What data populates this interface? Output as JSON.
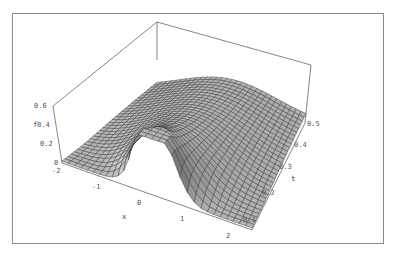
{
  "chart_data": {
    "type": "surface3d",
    "title": "",
    "function_description": "Gaussian diffusion profile f(x,t), peak at x=0 for small t, spreading and flattening as t increases",
    "axes": {
      "x": {
        "label": "x",
        "range": [
          -2,
          2
        ],
        "ticks": [
          "-2",
          "-1",
          "0",
          "1",
          "2"
        ]
      },
      "t": {
        "label": "t",
        "range": [
          0,
          0.5
        ],
        "ticks": [
          "0.1",
          "0.2",
          "0.3",
          "0.4",
          "0.5"
        ]
      },
      "f": {
        "label": "f",
        "range": [
          0,
          0.6
        ],
        "ticks": [
          "0",
          "0.2",
          "0.4",
          "0.6"
        ]
      }
    },
    "mesh": {
      "x_divisions": 30,
      "t_divisions": 30
    },
    "box": true,
    "grid": false,
    "legend": null,
    "colors": {
      "surface_fill": "#b4b4b4",
      "mesh_line": "#333333",
      "box_line": "#666666",
      "frame": "#8a8a8a"
    }
  },
  "labels": {
    "f_axis": "f",
    "x_axis": "x",
    "t_axis": "t",
    "f_ticks": [
      "0",
      "0.2",
      "0.4",
      "0.6"
    ],
    "x_ticks": [
      "-2",
      "-1",
      "0",
      "1",
      "2"
    ],
    "t_ticks": [
      "0.1",
      "0.2",
      "0.3",
      "0.4",
      "0.5"
    ]
  }
}
